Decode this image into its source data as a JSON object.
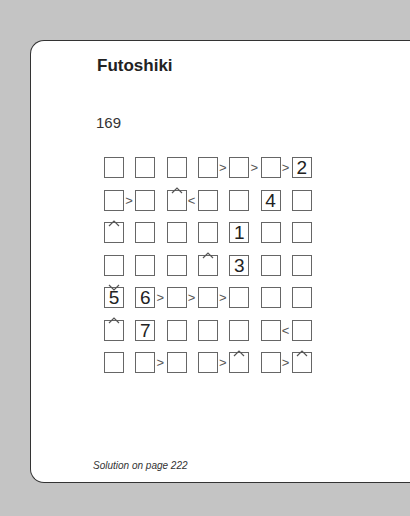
{
  "page": {
    "title": "Futoshiki",
    "puzzle_number": "169",
    "footer": "Solution on page 222"
  },
  "grid": {
    "size": 7,
    "givens": [
      [
        "",
        "",
        "",
        "",
        "",
        "",
        "2"
      ],
      [
        "",
        "",
        "",
        "",
        "",
        "4",
        ""
      ],
      [
        "",
        "",
        "",
        "",
        "1",
        "",
        ""
      ],
      [
        "",
        "",
        "",
        "",
        "3",
        "",
        ""
      ],
      [
        "5",
        "6",
        "",
        "",
        "",
        "",
        ""
      ],
      [
        "",
        "7",
        "",
        "",
        "",
        "",
        ""
      ],
      [
        "",
        "",
        "",
        "",
        "",
        "",
        ""
      ]
    ],
    "horizontal_constraints": [
      {
        "row": 0,
        "col": 3,
        "sign": ">"
      },
      {
        "row": 0,
        "col": 4,
        "sign": ">"
      },
      {
        "row": 0,
        "col": 5,
        "sign": ">"
      },
      {
        "row": 1,
        "col": 0,
        "sign": ">"
      },
      {
        "row": 1,
        "col": 2,
        "sign": "<"
      },
      {
        "row": 4,
        "col": 1,
        "sign": ">"
      },
      {
        "row": 4,
        "col": 2,
        "sign": ">"
      },
      {
        "row": 4,
        "col": 3,
        "sign": ">"
      },
      {
        "row": 5,
        "col": 5,
        "sign": "<"
      },
      {
        "row": 6,
        "col": 1,
        "sign": ">"
      },
      {
        "row": 6,
        "col": 3,
        "sign": ">"
      },
      {
        "row": 6,
        "col": 5,
        "sign": ">"
      }
    ],
    "vertical_constraints": [
      {
        "row": 0,
        "col": 2,
        "sign": "^"
      },
      {
        "row": 1,
        "col": 0,
        "sign": "^"
      },
      {
        "row": 2,
        "col": 3,
        "sign": "^"
      },
      {
        "row": 3,
        "col": 0,
        "sign": "v"
      },
      {
        "row": 4,
        "col": 0,
        "sign": "^"
      },
      {
        "row": 5,
        "col": 4,
        "sign": "^"
      },
      {
        "row": 5,
        "col": 6,
        "sign": "^"
      }
    ]
  }
}
